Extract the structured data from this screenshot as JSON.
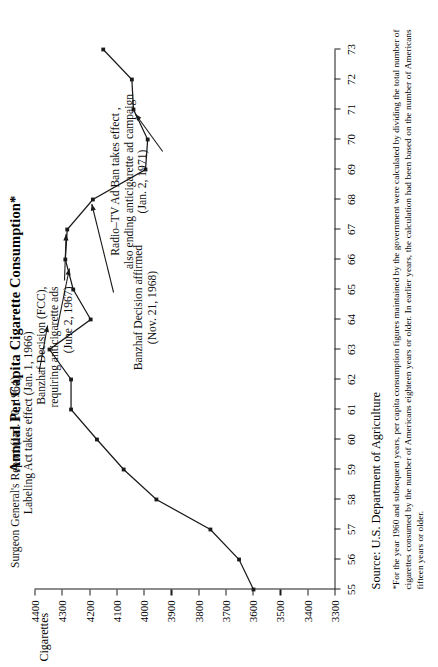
{
  "figure": {
    "title": "Annual Per Capita Cigarette Consumption*",
    "y_axis_label": "Cigarettes",
    "source": "Source: U.S. Department of Agriculture",
    "footnote": "*For the year 1960 and subsequent years, per capita consumption figures maintained by the government were calculated by dividing the total number of cigarettes consumed by the number of Americans eighteen years or older. In earlier years, the calculation had been based on the number of Americans fifteen years or older."
  },
  "annotations": [
    {
      "id": "surgeon-general",
      "lines": "Surgeon General's Report (Jan. 10, 1964)"
    },
    {
      "id": "labeling-act",
      "lines": "Labeling Act takes effect (Jan. 1, 1966)"
    },
    {
      "id": "banzhaf-decision",
      "lines": "Banzhaf Decision (FCC),\nrequiring anticigarette ads\n(June 2, 1967)"
    },
    {
      "id": "banzhaf-affirmed",
      "lines": "Banzhaf Decision affirmed\n(Nov. 21, 1968)"
    },
    {
      "id": "radio-tv-ad-ban",
      "lines": "Radio–TV Ad Ban takes effect ,\nalso ending anticigarette ad campaign\n(Jan. 2, 1971)"
    }
  ],
  "chart_data": {
    "type": "line",
    "title": "Annual Per Capita Cigarette Consumption*",
    "xlabel": "",
    "ylabel": "Cigarettes",
    "grid": false,
    "legend": "none",
    "orientation": "figure rotated 90° counter-clockwise on page",
    "xlim": [
      1955,
      1973
    ],
    "ylim": [
      3300,
      4400
    ],
    "x_tick_labels": [
      "55",
      "56",
      "57",
      "58",
      "59",
      "60",
      "61",
      "62",
      "63",
      "64",
      "65",
      "66",
      "67",
      "68",
      "69",
      "70",
      "71",
      "72",
      "73"
    ],
    "y_tick_labels": [
      "3300",
      "3400",
      "3500",
      "3600",
      "3700",
      "3800",
      "3900",
      "4000",
      "4100",
      "4200",
      "4300",
      "4400"
    ],
    "y_ticks": [
      3300,
      3400,
      3500,
      3600,
      3700,
      3800,
      3900,
      4000,
      4100,
      4200,
      4300,
      4400
    ],
    "x": [
      1955,
      1956,
      1957,
      1958,
      1959,
      1960,
      1961,
      1962,
      1963,
      1964,
      1965,
      1966,
      1967,
      1968,
      1969,
      1970,
      1971,
      1972,
      1973
    ],
    "values": [
      3597,
      3650,
      3755,
      3953,
      4073,
      4171,
      4266,
      4266,
      4345,
      4194,
      4258,
      4287,
      4280,
      4186,
      3993,
      3985,
      4037,
      4043,
      4148
    ],
    "series": [
      {
        "name": "Per capita cigarette consumption",
        "values": [
          3597,
          3650,
          3755,
          3953,
          4073,
          4171,
          4266,
          4266,
          4345,
          4194,
          4258,
          4287,
          4280,
          4186,
          3993,
          3985,
          4037,
          4043,
          4148
        ]
      }
    ],
    "markers": true,
    "marker_shape": "square",
    "line_color": "#1a1a1a",
    "annotations": [
      {
        "label": "Surgeon General's Report (Jan. 10, 1964)",
        "points_to_year": 1964
      },
      {
        "label": "Labeling Act takes effect (Jan. 1, 1966)",
        "points_to_year": 1966
      },
      {
        "label": "Banzhaf Decision (FCC), requiring anticigarette ads (June 2, 1967)",
        "points_to_year": 1967
      },
      {
        "label": "Banzhaf Decision affirmed (Nov. 21, 1968)",
        "points_to_year": 1968
      },
      {
        "label": "Radio–TV Ad Ban takes effect , also ending anticigarette ad campaign (Jan. 2, 1971)",
        "points_to_year": 1971
      }
    ]
  }
}
